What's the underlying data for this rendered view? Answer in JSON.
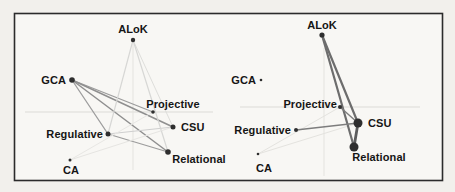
{
  "figure": {
    "page_background": "#f2f0ec",
    "panel_background": "#f8f7f4",
    "border_color": "#2b2b2b",
    "node_color": "#2e2e2e",
    "label_color": "#151515",
    "axis_h_color": "#dcdbd7",
    "axis_v_color": "#e4e3df"
  },
  "panels": [
    {
      "name": "left-network",
      "axes": {
        "h": {
          "x1": 25,
          "y": 112,
          "x2": 213
        },
        "v": {
          "x": 133,
          "y1": 44,
          "y2": 170
        }
      },
      "nodes": [
        {
          "id": "alok",
          "label": "ALoK",
          "x": 133,
          "y": 40,
          "r": 2.2,
          "lx": 133,
          "ly": 33,
          "anchor": "middle"
        },
        {
          "id": "gca",
          "label": "GCA",
          "x": 72,
          "y": 80,
          "r": 2.8,
          "lx": 66,
          "ly": 84,
          "anchor": "end"
        },
        {
          "id": "projective",
          "label": "Projective",
          "x": 153,
          "y": 112,
          "r": 1.8,
          "lx": 173,
          "ly": 108,
          "anchor": "middle"
        },
        {
          "id": "csu",
          "label": "CSU",
          "x": 173,
          "y": 127,
          "r": 2.5,
          "lx": 181,
          "ly": 131,
          "anchor": "start"
        },
        {
          "id": "regulative",
          "label": "Regulative",
          "x": 108,
          "y": 134,
          "r": 2.5,
          "lx": 103,
          "ly": 138,
          "anchor": "end"
        },
        {
          "id": "relational",
          "label": "Relational",
          "x": 168,
          "y": 152,
          "r": 2.8,
          "lx": 199,
          "ly": 163,
          "anchor": "middle"
        },
        {
          "id": "ca",
          "label": "CA",
          "x": 70,
          "y": 160,
          "r": 1.5,
          "lx": 71,
          "ly": 174,
          "anchor": "middle"
        }
      ],
      "edges": [
        {
          "from": "gca",
          "to": "projective",
          "color": "#9c9c9c",
          "w": 1.3
        },
        {
          "from": "gca",
          "to": "csu",
          "color": "#8f8f8f",
          "w": 1.5
        },
        {
          "from": "gca",
          "to": "relational",
          "color": "#8f8f8f",
          "w": 1.5
        },
        {
          "from": "gca",
          "to": "regulative",
          "color": "#9c9c9c",
          "w": 1.3
        },
        {
          "from": "regulative",
          "to": "relational",
          "color": "#9c9c9c",
          "w": 1.3
        },
        {
          "from": "regulative",
          "to": "csu",
          "color": "#cfcfcf",
          "w": 1.0
        },
        {
          "from": "alok",
          "to": "regulative",
          "color": "#d7d7d5",
          "w": 1.2
        },
        {
          "from": "alok",
          "to": "csu",
          "color": "#dededb",
          "w": 1.0
        },
        {
          "from": "alok",
          "to": "relational",
          "color": "#d7d7d5",
          "w": 1.2
        },
        {
          "from": "ca",
          "to": "csu",
          "color": "#e6e5e2",
          "w": 1.0
        },
        {
          "from": "ca",
          "to": "projective",
          "color": "#e8e7e4",
          "w": 1.0
        }
      ]
    },
    {
      "name": "right-network",
      "axes": {
        "h": {
          "x1": 240,
          "y": 107,
          "x2": 420
        },
        "v": {
          "x": 324,
          "y1": 48,
          "y2": 176
        }
      },
      "nodes": [
        {
          "id": "alok",
          "label": "ALoK",
          "x": 322,
          "y": 35,
          "r": 2.6,
          "lx": 322,
          "ly": 29,
          "anchor": "middle"
        },
        {
          "id": "gca",
          "label": "GCA",
          "x": 261,
          "y": 80,
          "r": 1.3,
          "lx": 256,
          "ly": 84,
          "anchor": "end"
        },
        {
          "id": "projective",
          "label": "Projective",
          "x": 340,
          "y": 107,
          "r": 2.0,
          "lx": 337,
          "ly": 108,
          "anchor": "end"
        },
        {
          "id": "csu",
          "label": "CSU",
          "x": 358,
          "y": 123,
          "r": 4.5,
          "lx": 368,
          "ly": 127,
          "anchor": "start"
        },
        {
          "id": "regulative",
          "label": "Regulative",
          "x": 296,
          "y": 130,
          "r": 2.0,
          "lx": 291,
          "ly": 134,
          "anchor": "end"
        },
        {
          "id": "relational",
          "label": "Relational",
          "x": 354,
          "y": 147,
          "r": 4.5,
          "lx": 379,
          "ly": 161,
          "anchor": "middle"
        },
        {
          "id": "ca",
          "label": "CA",
          "x": 258,
          "y": 154,
          "r": 1.3,
          "lx": 264,
          "ly": 172,
          "anchor": "middle"
        }
      ],
      "edges": [
        {
          "from": "projective",
          "to": "ca",
          "color": "#e4e3df",
          "w": 1.0
        },
        {
          "from": "csu",
          "to": "ca",
          "color": "#e4e3df",
          "w": 1.0
        },
        {
          "from": "alok",
          "to": "csu",
          "color": "#6d6d6d",
          "w": 2.2
        },
        {
          "from": "alok",
          "to": "relational",
          "color": "#6d6d6d",
          "w": 2.2
        },
        {
          "from": "csu",
          "to": "relational",
          "color": "#5c5c5c",
          "w": 2.8
        },
        {
          "from": "projective",
          "to": "csu",
          "color": "#7d7d7d",
          "w": 1.4
        },
        {
          "from": "regulative",
          "to": "csu",
          "color": "#7d7d7d",
          "w": 1.4
        }
      ]
    }
  ]
}
